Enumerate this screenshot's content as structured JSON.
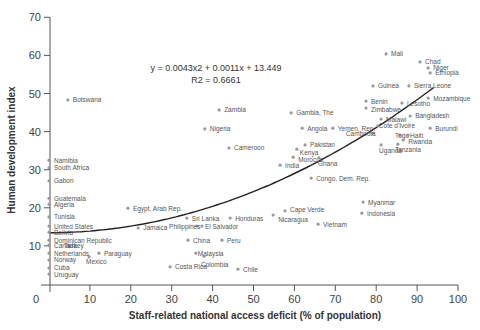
{
  "chart_data": {
    "type": "scatter",
    "title": "",
    "xlabel": "Staff-related national access deficit (% of population)",
    "ylabel": "Human development index",
    "xlim": [
      0,
      100
    ],
    "ylim": [
      0,
      70
    ],
    "xticks": [
      0,
      10,
      20,
      30,
      40,
      50,
      60,
      70,
      80,
      90,
      100
    ],
    "yticks": [
      0,
      10,
      20,
      30,
      40,
      50,
      60,
      70
    ],
    "grid": false,
    "legend": null,
    "trendline": {
      "type": "polynomial",
      "equation": "y = 0.0043x2 + 0.0011x + 13.449",
      "r2_label": "R2 = 0.6661",
      "coefficients": {
        "a": 0.0043,
        "b": 0.0011,
        "c": 13.449
      },
      "x_range": [
        0,
        94
      ]
    },
    "points": [
      {
        "label": "Botswana",
        "x": 4.6,
        "y": 48.3
      },
      {
        "label": "Zambia",
        "x": 41.6,
        "y": 45.7
      },
      {
        "label": "Nigeria",
        "x": 38.1,
        "y": 40.7
      },
      {
        "label": "Cameroon",
        "x": 44.0,
        "y": 35.7
      },
      {
        "label": "Gambia, The",
        "x": 59.2,
        "y": 44.9
      },
      {
        "label": "Angola",
        "x": 61.9,
        "y": 40.9
      },
      {
        "label": "Yemen, Rep.",
        "x": 69.4,
        "y": 40.9
      },
      {
        "label": "Pakistan",
        "x": 62.6,
        "y": 36.5
      },
      {
        "label": "Kenya",
        "x": 60.6,
        "y": 35.4
      },
      {
        "label": "Morocco",
        "x": 59.7,
        "y": 33.3
      },
      {
        "label": "Ghana",
        "x": 66.0,
        "y": 33.1
      },
      {
        "label": "India",
        "x": 56.5,
        "y": 31.2
      },
      {
        "label": "Congo, Dem. Rep.",
        "x": 64.1,
        "y": 27.8
      },
      {
        "label": "Mali",
        "x": 82.4,
        "y": 60.4
      },
      {
        "label": "Chad",
        "x": 90.7,
        "y": 58.3
      },
      {
        "label": "Niger",
        "x": 92.7,
        "y": 56.7
      },
      {
        "label": "Ethiopia",
        "x": 93.2,
        "y": 55.4
      },
      {
        "label": "Guinea",
        "x": 79.2,
        "y": 52.0
      },
      {
        "label": "Sierra Leone",
        "x": 88.0,
        "y": 52.0
      },
      {
        "label": "Mozambique",
        "x": 92.7,
        "y": 48.8
      },
      {
        "label": "Benin",
        "x": 77.5,
        "y": 48.0
      },
      {
        "label": "Zimbabwe",
        "x": 77.5,
        "y": 46.2
      },
      {
        "label": "Lesotho",
        "x": 86.3,
        "y": 47.5
      },
      {
        "label": "Bangladesh",
        "x": 88.3,
        "y": 44.1
      },
      {
        "label": "Malawi",
        "x": 81.2,
        "y": 43.3
      },
      {
        "label": "Cote d'Ivoire",
        "x": 80.4,
        "y": 41.5
      },
      {
        "label": "Burundi",
        "x": 93.2,
        "y": 40.9
      },
      {
        "label": "Cambodia",
        "x": 79.2,
        "y": 39.6
      },
      {
        "label": "Togo",
        "x": 85.8,
        "y": 39.1
      },
      {
        "label": "Haiti",
        "x": 87.8,
        "y": 39.1
      },
      {
        "label": "Rwanda",
        "x": 86.6,
        "y": 37.8
      },
      {
        "label": "Tanzania",
        "x": 85.3,
        "y": 36.7
      },
      {
        "label": "Uganda",
        "x": 81.2,
        "y": 36.5
      },
      {
        "label": "Myanmar",
        "x": 76.8,
        "y": 21.5
      },
      {
        "label": "Indonesia",
        "x": 76.5,
        "y": 18.6
      },
      {
        "label": "Vietnam",
        "x": 65.8,
        "y": 15.7
      },
      {
        "label": "Cape Verde",
        "x": 57.7,
        "y": 19.2
      },
      {
        "label": "Nicaragua",
        "x": 54.8,
        "y": 18.1
      },
      {
        "label": "Egypt, Arab Rep.",
        "x": 19.3,
        "y": 19.9
      },
      {
        "label": "Jamaica",
        "x": 21.8,
        "y": 14.7
      },
      {
        "label": "Sri Lanka",
        "x": 33.7,
        "y": 17.3
      },
      {
        "label": "Honduras",
        "x": 44.3,
        "y": 17.3
      },
      {
        "label": "Philippines",
        "x": 36.2,
        "y": 15.2
      },
      {
        "label": "El Salvador",
        "x": 37.4,
        "y": 15.2
      },
      {
        "label": "China",
        "x": 34.0,
        "y": 11.5
      },
      {
        "label": "Peru",
        "x": 42.3,
        "y": 11.5
      },
      {
        "label": "Malaysia",
        "x": 35.9,
        "y": 8.1
      },
      {
        "label": "Colombia",
        "x": 37.9,
        "y": 7.3
      },
      {
        "label": "Costa Rica",
        "x": 29.6,
        "y": 4.5
      },
      {
        "label": "Chile",
        "x": 46.2,
        "y": 3.9
      },
      {
        "label": "Paraguay",
        "x": 12.2,
        "y": 8.1
      },
      {
        "label": "Mexico",
        "x": 9.8,
        "y": 7.1
      },
      {
        "label": "Turkey",
        "x": 4.9,
        "y": 10.0
      },
      {
        "label": "Namibia",
        "x": 0,
        "y": 32.5
      },
      {
        "label": "South Africa",
        "x": 0,
        "y": 30.5
      },
      {
        "label": "Gabon",
        "x": 0,
        "y": 27.1
      },
      {
        "label": "Guatemala",
        "x": 0,
        "y": 22.5
      },
      {
        "label": "Algeria",
        "x": 0,
        "y": 20.9
      },
      {
        "label": "Tunisia",
        "x": 0,
        "y": 17.6
      },
      {
        "label": "United States",
        "x": 0,
        "y": 15.2
      },
      {
        "label": "Bolivia",
        "x": 0,
        "y": 13.6
      },
      {
        "label": "Dominican Republic",
        "x": 0,
        "y": 11.5
      },
      {
        "label": "Canada",
        "x": 0,
        "y": 10.2
      },
      {
        "label": "Netherlands",
        "x": 0,
        "y": 8.1
      },
      {
        "label": "Norway",
        "x": 0,
        "y": 6.3
      },
      {
        "label": "Cuba",
        "x": 0,
        "y": 4.2
      },
      {
        "label": "Uruguay",
        "x": 0,
        "y": 2.6
      }
    ],
    "label_offsets": {
      "Kenya": [
        -2,
        3
      ],
      "Morocco": [
        0,
        2
      ],
      "Ghana": [
        -6,
        6
      ],
      "Yemen, Rep.": [
        0,
        0
      ],
      "Nicaragua": [
        0,
        4
      ],
      "Cape Verde": [
        0,
        -1
      ],
      "Philippines": [
        -33,
        0
      ],
      "El Salvador": [
        -2,
        0
      ],
      "Malaysia": [
        -3,
        0
      ],
      "Colombia": [
        -8,
        8
      ],
      "Mexico": [
        -8,
        5
      ],
      "Turkey": [
        -10,
        0
      ],
      "Togo": [
        -10,
        0
      ],
      "Haiti": [
        -3,
        0
      ],
      "Tanzania": [
        -8,
        5
      ],
      "Rwanda": [
        0,
        2
      ],
      "Uganda": [
        -7,
        6
      ],
      "Zimbabwe": [
        0,
        2
      ],
      "Cambodia": [
        -32,
        0
      ],
      "Cote d'Ivoire": [
        -4,
        0
      ],
      "Malawi": [
        0,
        0
      ],
      "Niger": [
        0,
        0
      ],
      "Chad": [
        0,
        0
      ]
    }
  },
  "colors": {
    "axis": "#555555",
    "point": "#999999",
    "trendline": "#222222",
    "text": "#444444"
  }
}
